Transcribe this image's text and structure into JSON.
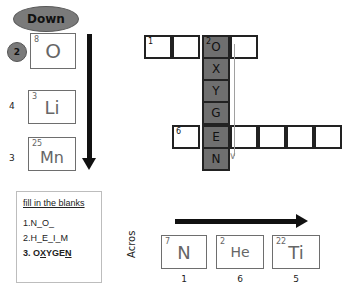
{
  "down_section": {
    "label": "Down",
    "badge_number": "2",
    "cards": [
      {
        "atomic_number": "8",
        "symbol": "O",
        "side_number": "2"
      },
      {
        "atomic_number": "3",
        "symbol": "Li",
        "side_number": "4"
      },
      {
        "atomic_number": "25",
        "symbol": "Mn",
        "side_number": "3"
      }
    ],
    "arrow_icon": "down-arrow"
  },
  "fill_in_blanks": {
    "title": "fill in the blanks",
    "lines": [
      {
        "text": "1.N_O_"
      },
      {
        "text": "2.H_E_I_M"
      },
      {
        "prefix": "3. O",
        "u1": "X",
        "mid": "YGE",
        "u2": "N"
      }
    ]
  },
  "crossword": {
    "row1": {
      "clue_number": "1",
      "cells": [
        "",
        "",
        "O",
        ""
      ]
    },
    "down2": {
      "clue_number": "2",
      "letters": [
        "O",
        "X",
        "Y",
        "G",
        "E",
        "N"
      ]
    },
    "row6": {
      "clue_number": "6",
      "cells": [
        "",
        "E",
        "",
        "",
        "",
        ""
      ]
    }
  },
  "across_section": {
    "label": "Acros",
    "arrow_icon": "right-arrow",
    "cards": [
      {
        "atomic_number": "7",
        "symbol": "N",
        "bottom_number": "1"
      },
      {
        "atomic_number": "2",
        "symbol": "He",
        "bottom_number": "6"
      },
      {
        "atomic_number": "22",
        "symbol": "Ti",
        "bottom_number": "5"
      }
    ]
  }
}
